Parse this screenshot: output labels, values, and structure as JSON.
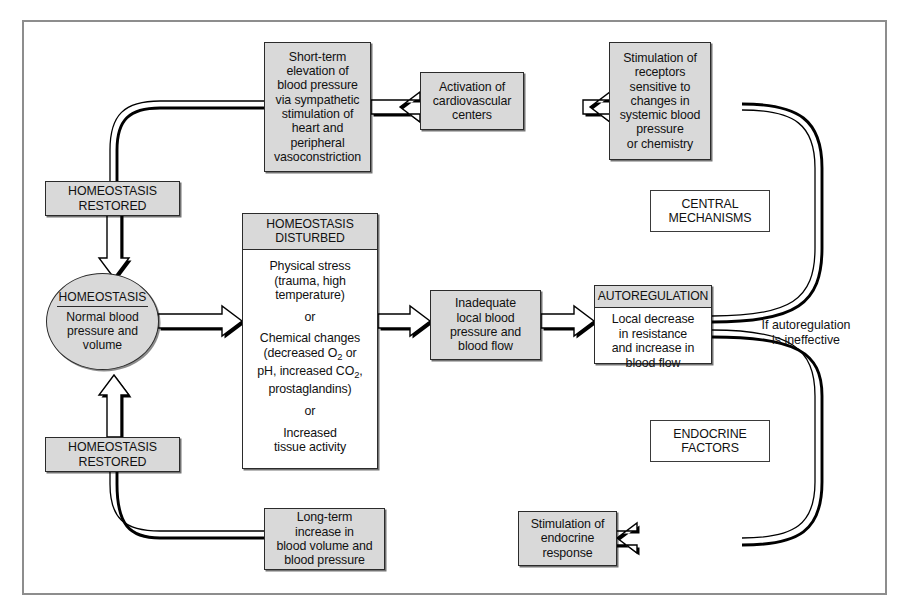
{
  "figure": {
    "frame_color": "#8d8d8d",
    "box_fill": "#d9d9d9",
    "line_color": "#000000"
  },
  "nodes": {
    "short_term": {
      "name": "short-term-elevation",
      "lines": [
        "Short-term",
        "elevation of",
        "blood pressure",
        "via sympathetic",
        "stimulation of",
        "heart and",
        "peripheral",
        "vasoconstriction"
      ]
    },
    "activation": {
      "name": "activation-cardiovascular-centers",
      "lines": [
        "Activation of",
        "cardiovascular",
        "centers"
      ]
    },
    "stimulation_receptors": {
      "name": "stimulation-of-receptors",
      "lines": [
        "Stimulation of",
        "receptors",
        "sensitive to",
        "changes in",
        "systemic blood",
        "pressure",
        "or chemistry"
      ]
    },
    "homeostasis_restored_top": {
      "name": "homeostasis-restored-top",
      "lines": [
        "HOMEOSTASIS",
        "RESTORED"
      ]
    },
    "homeostasis_restored_bottom": {
      "name": "homeostasis-restored-bottom",
      "lines": [
        "HOMEOSTASIS",
        "RESTORED"
      ]
    },
    "homeostasis_circle": {
      "name": "homeostasis-circle",
      "title": "HOMEOSTASIS",
      "lines": [
        "Normal blood",
        "pressure and",
        "volume"
      ]
    },
    "homeostasis_disturbed": {
      "name": "homeostasis-disturbed",
      "header": [
        "HOMEOSTASIS",
        "DISTURBED"
      ],
      "group1": [
        "Physical stress",
        "(trauma, high",
        "temperature)"
      ],
      "or1": "or",
      "group2_line1": "Chemical changes",
      "group2_line2_pre": "(decreased O",
      "group2_line2_sub": "2",
      "group2_line2_post": " or",
      "group2_line3_pre": "pH, increased CO",
      "group2_line3_sub": "2",
      "group2_line3_post": ",",
      "group2_line4": "prostaglandins)",
      "or2": "or",
      "group3": [
        "Increased",
        "tissue activity"
      ]
    },
    "inadequate": {
      "name": "inadequate-local-blood-flow",
      "lines": [
        "Inadequate",
        "local blood",
        "pressure and",
        "blood flow"
      ]
    },
    "autoregulation": {
      "name": "autoregulation",
      "header": [
        "AUTOREGULATION"
      ],
      "lines": [
        "Local decrease",
        "in resistance",
        "and increase in",
        "blood flow"
      ]
    },
    "central_mechanisms": {
      "name": "central-mechanisms-label",
      "lines": [
        "CENTRAL",
        "MECHANISMS"
      ]
    },
    "endocrine_factors": {
      "name": "endocrine-factors-label",
      "lines": [
        "ENDOCRINE",
        "FACTORS"
      ]
    },
    "long_term": {
      "name": "long-term-increase",
      "lines": [
        "Long-term",
        "increase in",
        "blood volume and",
        "blood pressure"
      ]
    },
    "stimulation_endocrine": {
      "name": "stimulation-of-endocrine-response",
      "lines": [
        "Stimulation of",
        "endocrine",
        "response"
      ]
    }
  },
  "annotations": {
    "if_autoregulation": {
      "name": "if-autoregulation-ineffective-label",
      "lines": [
        "If autoregulation",
        "is ineffective"
      ]
    }
  }
}
